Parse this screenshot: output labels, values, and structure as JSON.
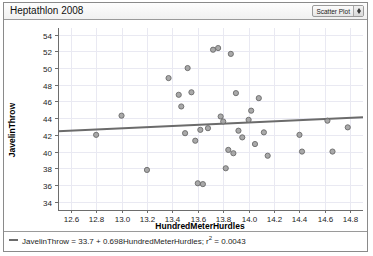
{
  "window": {
    "title": "Heptathlon 2008"
  },
  "toolbar": {
    "plot_type_label": "Scatter Plot",
    "stepper_up_icon": "chevron-up-icon",
    "stepper_down_icon": "chevron-down-icon"
  },
  "legend": {
    "equation_prefix": "JavelinThrow = 33.7 + 0.698HundredMeterHurdles; r",
    "equation_superscript": "2",
    "equation_suffix": " = 0.0043",
    "line_color": "#6b6b6b"
  },
  "colors": {
    "point_fill": "#9a9a9a",
    "point_stroke": "#6a6a6a",
    "grid": "#e9e9f2",
    "axis": "#6d6d6d",
    "trend": "#6b6b6b"
  },
  "chart_data": {
    "type": "scatter",
    "title": "Heptathlon 2008",
    "xlabel": "HundredMeterHurdles",
    "ylabel": "JavelinThrow",
    "xlim": [
      12.5,
      14.9
    ],
    "ylim": [
      33.0,
      54.8
    ],
    "xticks": [
      12.6,
      12.8,
      13.0,
      13.2,
      13.4,
      13.6,
      13.8,
      14.0,
      14.2,
      14.4,
      14.6,
      14.8
    ],
    "yticks": [
      34,
      36,
      38,
      40,
      42,
      44,
      46,
      48,
      50,
      52,
      54
    ],
    "grid": true,
    "legend_position": "bottom-left",
    "series": [
      {
        "name": "JavelinThrow vs HundredMeterHurdles",
        "points": [
          [
            12.8,
            42.0
          ],
          [
            13.0,
            44.3
          ],
          [
            13.2,
            37.8
          ],
          [
            13.37,
            48.8
          ],
          [
            13.45,
            46.8
          ],
          [
            13.47,
            45.4
          ],
          [
            13.5,
            42.2
          ],
          [
            13.52,
            50.0
          ],
          [
            13.55,
            47.1
          ],
          [
            13.58,
            41.3
          ],
          [
            13.6,
            36.2
          ],
          [
            13.62,
            42.6
          ],
          [
            13.64,
            36.1
          ],
          [
            13.68,
            42.8
          ],
          [
            13.72,
            52.2
          ],
          [
            13.76,
            52.4
          ],
          [
            13.78,
            44.2
          ],
          [
            13.8,
            43.6
          ],
          [
            13.82,
            38.0
          ],
          [
            13.84,
            40.2
          ],
          [
            13.86,
            51.7
          ],
          [
            13.88,
            39.8
          ],
          [
            13.9,
            47.0
          ],
          [
            13.92,
            42.5
          ],
          [
            13.95,
            41.7
          ],
          [
            14.0,
            43.8
          ],
          [
            14.02,
            44.9
          ],
          [
            14.05,
            40.9
          ],
          [
            14.08,
            46.4
          ],
          [
            14.12,
            42.3
          ],
          [
            14.15,
            39.5
          ],
          [
            14.4,
            42.0
          ],
          [
            14.42,
            40.0
          ],
          [
            14.62,
            43.7
          ],
          [
            14.66,
            40.0
          ],
          [
            14.78,
            42.9
          ]
        ]
      }
    ],
    "trend_line": {
      "intercept": 33.7,
      "slope": 0.698,
      "r_squared": 0.0043,
      "x_start": 12.5,
      "x_end": 14.9
    }
  }
}
